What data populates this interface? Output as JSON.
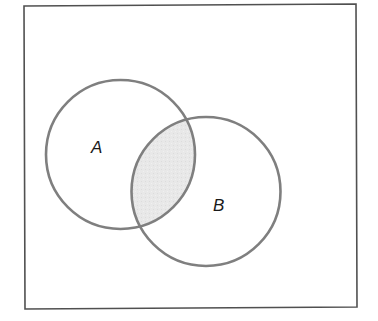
{
  "diagram": {
    "type": "venn",
    "title": "",
    "universe": {
      "label": "",
      "frame": {
        "x1": 24,
        "y1": 5,
        "x2": 356,
        "y2": 308
      },
      "stroke_color": "#505050"
    },
    "sets": [
      {
        "id": "A",
        "label": "A",
        "cx": 120.5,
        "cy": 154.5,
        "r": 74.5,
        "label_x": 92,
        "label_y": 153
      },
      {
        "id": "B",
        "label": "B",
        "cx": 206,
        "cy": 191.5,
        "r": 74.5,
        "label_x": 213,
        "label_y": 211
      }
    ],
    "shaded_region": {
      "description": "A ∩ B",
      "fill_color": "#e6e6e6"
    },
    "circle_stroke_color": "#7f7f7f"
  }
}
